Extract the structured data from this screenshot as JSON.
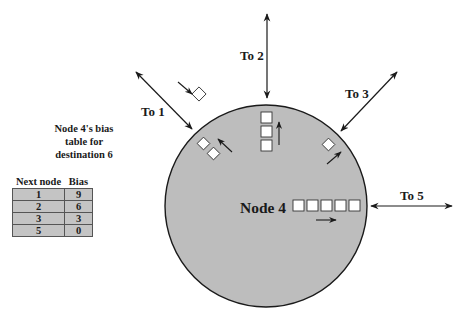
{
  "diagram": {
    "node_label": "Node 4",
    "links": [
      {
        "id": "to1",
        "label": "To 1"
      },
      {
        "id": "to2",
        "label": "To 2"
      },
      {
        "id": "to3",
        "label": "To 3"
      },
      {
        "id": "to5",
        "label": "To 5"
      }
    ],
    "queues": {
      "to1_out": 2,
      "to1_in_transit": 1,
      "to2_out": 3,
      "to3_out": 1,
      "to5_out": 5
    },
    "colors": {
      "node_fill": "#bdbdbd",
      "table_fill": "#c4c4c4",
      "ink": "#1a1a1a"
    }
  },
  "bias_table": {
    "title_lines": [
      "Node 4's bias",
      "table for",
      "destination 6"
    ],
    "headers": [
      "Next node",
      "Bias"
    ],
    "rows": [
      {
        "next_node": "1",
        "bias": "9"
      },
      {
        "next_node": "2",
        "bias": "6"
      },
      {
        "next_node": "3",
        "bias": "3"
      },
      {
        "next_node": "5",
        "bias": "0"
      }
    ]
  }
}
